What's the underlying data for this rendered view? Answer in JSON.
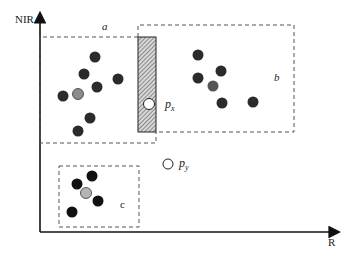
{
  "diagram": {
    "axes": {
      "y_label": "NIR",
      "x_label": "R"
    },
    "regions": {
      "a": {
        "label": "a"
      },
      "b": {
        "label": "b"
      },
      "c": {
        "label": "c"
      }
    },
    "points": {
      "px": {
        "label": "p",
        "sub": "x"
      },
      "py": {
        "label": "p",
        "sub": "y"
      }
    },
    "colors": {
      "dark_dot": "#2b2b2b",
      "gray_dot": "#8c8c8c",
      "mid_dot": "#555555",
      "hatch": "#9a9a9a",
      "line": "#222222"
    }
  }
}
